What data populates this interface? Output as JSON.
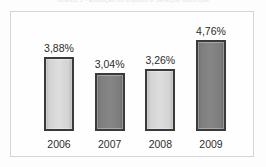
{
  "figure": {
    "caption": "Gráfico 1 - Evolução do Imposto e Serviços Municipal",
    "caption_visible": "partially clipped at top edge"
  },
  "frame": {
    "border_color": "#d5d5d5",
    "background": "#fefefe"
  },
  "chart_data": {
    "type": "bar",
    "title": "Gráfico 1 - Evolução do Imposto e Serviços Municipal",
    "xlabel": "",
    "ylabel": "",
    "categories": [
      "2006",
      "2007",
      "2008",
      "2009"
    ],
    "values": [
      3.88,
      3.04,
      3.26,
      4.76
    ],
    "value_labels": [
      "3,88%",
      "3,04%",
      "3,26%",
      "4,76%"
    ],
    "unit": "%",
    "decimal_separator": ",",
    "ylim": [
      0,
      5.2
    ],
    "grid": false,
    "axis_visible": false,
    "legend": false,
    "bar_fills": [
      "#dedede",
      "#868686",
      "#dedede",
      "#868686"
    ],
    "bar_border_color": "#3a3a3a",
    "series": [
      {
        "name": "Percentual",
        "points": [
          {
            "category": "2006",
            "value": 3.88,
            "label": "3,88%",
            "fill": "light"
          },
          {
            "category": "2007",
            "value": 3.04,
            "label": "3,04%",
            "fill": "dark"
          },
          {
            "category": "2008",
            "value": 3.26,
            "label": "3,26%",
            "fill": "light"
          },
          {
            "category": "2009",
            "value": 4.76,
            "label": "4,76%",
            "fill": "dark"
          }
        ]
      }
    ]
  }
}
